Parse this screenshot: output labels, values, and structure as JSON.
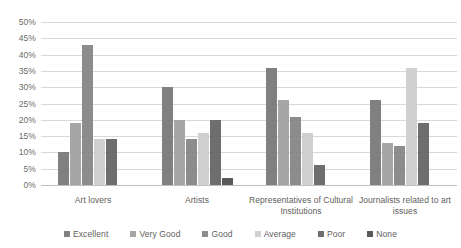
{
  "chart_data": {
    "type": "bar",
    "title": "",
    "subtitle": "",
    "xlabel": "",
    "ylabel": "",
    "ylim": [
      0,
      50
    ],
    "ytick_labels": [
      "50%",
      "45%",
      "40%",
      "35%",
      "30%",
      "25%",
      "20%",
      "15%",
      "10%",
      "5%",
      "0%"
    ],
    "ytick_values": [
      50,
      45,
      40,
      35,
      30,
      25,
      20,
      15,
      10,
      5,
      0
    ],
    "grid": true,
    "legend_position": "bottom",
    "categories": [
      "Art lovers",
      "Artists",
      "Representatives of Cultural Institutions",
      "Journalists related to art issues"
    ],
    "series": [
      {
        "name": "Excellent",
        "color": "#808080",
        "values": [
          10,
          30,
          36,
          26
        ]
      },
      {
        "name": "Very Good",
        "color": "#a6a6a6",
        "values": [
          19,
          20,
          26,
          13
        ]
      },
      {
        "name": "Good",
        "color": "#8c8c8c",
        "values": [
          43,
          14,
          21,
          12
        ]
      },
      {
        "name": "Average",
        "color": "#d0d0d0",
        "values": [
          14,
          16,
          16,
          36
        ]
      },
      {
        "name": "Poor",
        "color": "#6e6e6e",
        "values": [
          14,
          20,
          6,
          19
        ]
      },
      {
        "name": "None",
        "color": "#5a5a5a",
        "values": [
          0,
          2,
          0,
          0
        ]
      }
    ]
  }
}
